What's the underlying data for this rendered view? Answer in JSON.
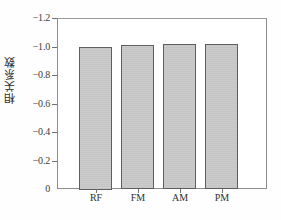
{
  "chart_data": {
    "type": "bar",
    "title": "",
    "xlabel": "",
    "ylabel": "相关系数",
    "categories": [
      "RF",
      "FM",
      "AM",
      "PM"
    ],
    "values": [
      -1.0,
      -1.01,
      -1.015,
      -1.015
    ],
    "ylim": [
      0,
      -1.2
    ],
    "y_ticks": [
      -1.2,
      -1.0,
      -0.8,
      -0.6,
      -0.4,
      -0.2,
      0
    ],
    "y_tick_labels": [
      "−1.2",
      "−1.0",
      "−0.8",
      "−0.6",
      "−0.4",
      "−0.2",
      "0"
    ],
    "y_axis_inverted": true,
    "grid": false,
    "legend": null,
    "bar_fill_color": "#cacaca",
    "bar_border_color": "#5f5f5f",
    "axis_color": "#8d8d8d",
    "background_color": "#ffffff"
  }
}
